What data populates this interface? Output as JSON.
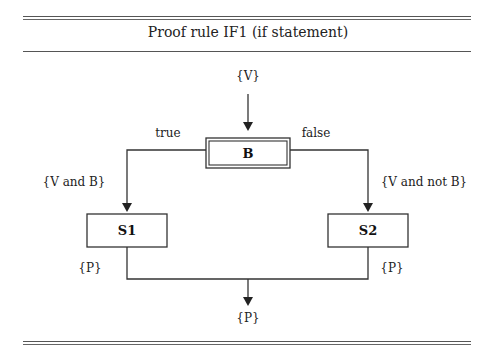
{
  "figure": {
    "title": "Proof rule IF1 (if statement)"
  },
  "diagram": {
    "precondition": "{V}",
    "condition_box": "B",
    "branch_true_label": "true",
    "branch_false_label": "false",
    "true_assertion": "{V and B}",
    "false_assertion": "{V and not B}",
    "statement_true": "S1",
    "statement_false": "S2",
    "post_true": "{P}",
    "post_false": "{P}",
    "postcondition": "{P}"
  },
  "colors": {
    "line": "#333333",
    "text": "#222222",
    "background": "#ffffff"
  }
}
